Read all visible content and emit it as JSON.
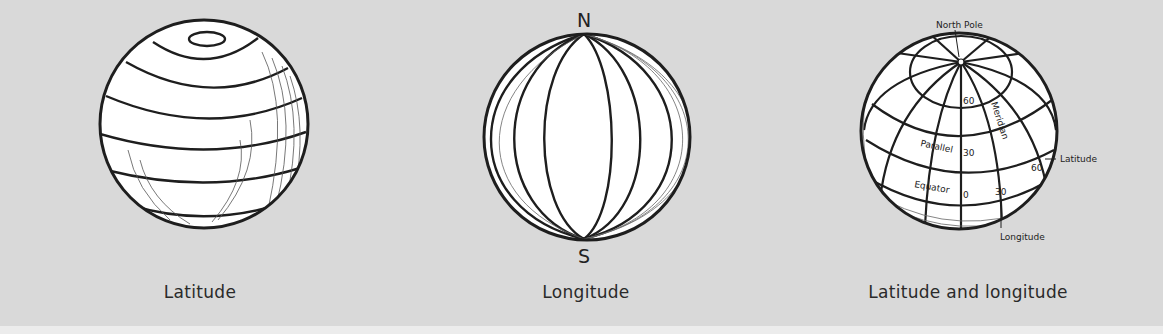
{
  "panels": [
    {
      "id": "latitude",
      "caption": "Latitude"
    },
    {
      "id": "longitude",
      "caption": "Longitude",
      "labels": {
        "north": "N",
        "south": "S"
      }
    },
    {
      "id": "latitude-and-longitude",
      "caption": "Latitude and longitude",
      "labels": {
        "north_pole": "North Pole",
        "meridian": "Meridian",
        "parallel": "Parallel",
        "equator": "Equator",
        "latitude": "Latitude",
        "longitude": "Longitude",
        "lat_60": "60",
        "lat_30": "30",
        "lat_0": "0",
        "lon_30": "30",
        "lon_60": "60"
      }
    }
  ],
  "colors": {
    "background": "#d9d9d9",
    "globe_fill": "#ffffff",
    "line": "#1e1e1e",
    "text": "#2a2a2a"
  }
}
